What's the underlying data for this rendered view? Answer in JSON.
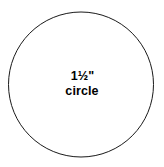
{
  "canvas": {
    "width": 164,
    "height": 167,
    "background_color": "#ffffff"
  },
  "shape": {
    "name": "circle-outline",
    "type": "circle",
    "center_x": 81,
    "center_y": 84.5,
    "radius": 72.5,
    "stroke_color": "#1a1a1a",
    "stroke_width": 1,
    "fill_color": "none"
  },
  "label": {
    "size_text": "1½\"",
    "shape_text": "circle",
    "text_color": "#000000"
  }
}
